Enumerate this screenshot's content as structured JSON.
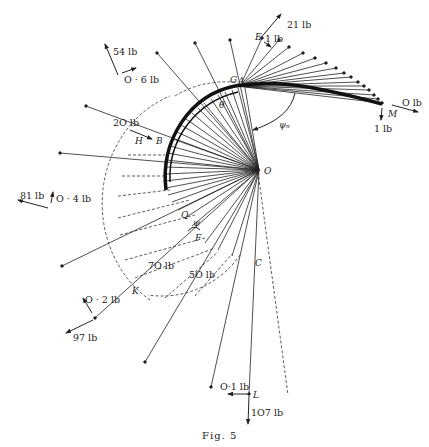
{
  "figure": {
    "caption": "Fig. 5",
    "origin_label": "O",
    "angle_labels": {
      "psi_n": "ψₙ",
      "psi": "ψ"
    },
    "point_labels": {
      "A": "A",
      "B": "B",
      "C": "C",
      "E": "E",
      "F": "F",
      "G": "G",
      "H": "H",
      "K": "K",
      "L": "L",
      "M": "M",
      "Q": "Q",
      "theta": "θ"
    },
    "force_labels": {
      "f21": "21 lb",
      "f1_top": "1 lb",
      "f54": "54 lb",
      "f06": "O · 6 lb",
      "f20": "2O lb",
      "f0": "O lb",
      "f1_right": "1 lb",
      "f81": "81 lb",
      "f04": "O · 4 lb",
      "f70": "7O lb",
      "f50": "5O lb",
      "f02": "O · 2 lb",
      "f97": "97 lb",
      "f01": "O·1 lb",
      "f107": "1O7 lb"
    },
    "colors": {
      "ink": "#222222",
      "paper": "#ffffff"
    }
  }
}
